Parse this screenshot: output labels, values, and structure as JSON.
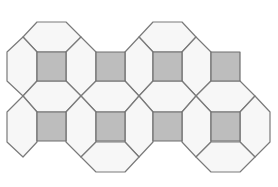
{
  "diagram": {
    "type": "tiling",
    "colors": {
      "background": "#ffffff",
      "light_tile_fill": "#f7f7f7",
      "dark_square_fill": "#bdbdbd",
      "edge_stroke": "#7a7a7a"
    },
    "square_size": 29,
    "squares": [
      {
        "x": 37,
        "y": 52
      },
      {
        "x": 96,
        "y": 52
      },
      {
        "x": 153,
        "y": 52
      },
      {
        "x": 211,
        "y": 52
      },
      {
        "x": 37,
        "y": 112
      },
      {
        "x": 96,
        "y": 112
      },
      {
        "x": 153,
        "y": 112
      },
      {
        "x": 211,
        "y": 112
      }
    ],
    "light_tiles": [
      {
        "points": "37,22 66,22 81,37 66,52 37,52 23,37"
      },
      {
        "points": "23,37 37,52 37,81 23,96 7,81 7,52"
      },
      {
        "points": "81,37 96,52 96,81 81,96 66,81 66,52"
      },
      {
        "points": "37,81 66,81 81,96 66,112 37,112 23,96"
      },
      {
        "points": "153,22 182,22 196,37 182,52 153,52 139,37"
      },
      {
        "points": "139,37 153,52 153,81 139,96 125,81 125,52"
      },
      {
        "points": "196,37 211,52 211,81 196,96 182,81 182,52"
      },
      {
        "points": "153,81 182,81 196,96 182,112 153,112 139,96"
      },
      {
        "points": "96,81 125,81 139,96 125,112 96,112 81,96"
      },
      {
        "points": "81,96 96,112 96,142 81,157 66,142 66,112"
      },
      {
        "points": "139,96 153,112 153,142 139,157 125,142 125,112"
      },
      {
        "points": "96,142 125,142 139,157 125,172 96,172 81,157"
      },
      {
        "points": "211,81 240,81 255,96 240,112 211,112 196,96"
      },
      {
        "points": "196,96 211,112 211,142 196,157 182,142 182,112"
      },
      {
        "points": "255,96 270,112 270,142 255,157 240,142 240,112"
      },
      {
        "points": "211,142 240,142 255,157 240,172 211,172 196,157"
      },
      {
        "points": "23,96 37,112 37,142 23,157 7,142 7,112"
      }
    ],
    "clip_outline": "37,22 66,22 81,37 96,52 125,52 139,37 153,22 182,22 196,37 211,52 240,52 240,81 255,96 270,112 270,142 255,157 240,172 211,172 196,157 182,142 153,142 139,157 125,172 96,172 81,157 66,142 37,142 37,112 23,96 7,81 7,52 23,37"
  }
}
